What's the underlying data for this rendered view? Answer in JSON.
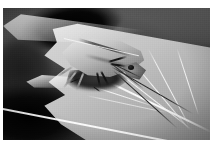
{
  "image": {
    "kind": "photograph",
    "subject": "stink bug (shield bug) resting on the edge of a chewed leaf",
    "color_mode": "grayscale",
    "border": {
      "style": "white photo border",
      "color": "#ffffff",
      "top_px": 8,
      "left_px": 3,
      "right_px": 2,
      "bottom_px": 5
    },
    "canvas": {
      "width_px": 207,
      "height_px": 132
    },
    "palette": {
      "border_white": "#ffffff",
      "leaf_highlight": "#f2f2f2",
      "leaf_midtone": "#c0c0c0",
      "leaf_shadow": "#8f8f8f",
      "background_dark": "#0b0b0b",
      "background_mid": "#4a4a4a",
      "bug_body_light": "#d8d8d8",
      "bug_body_dark": "#6a6a6a",
      "bug_underside": "#202020",
      "limb_dark": "#2e2e2e"
    },
    "regions": [
      {
        "name": "background-foliage",
        "description": "out-of-focus dark foliage filling the upper-left and lower-left corners"
      },
      {
        "name": "leaf",
        "description": "large sunlit leaf occupying the right two thirds, its bright margin running diagonally from upper-left to right"
      },
      {
        "name": "leaf-veins",
        "description": "pale veins radiating from the lower-left toward the upper-right margin",
        "count": 7
      },
      {
        "name": "leaf-damage",
        "description": "torn and chewed notches along the lower-left leaf margin with a dark gap behind"
      },
      {
        "name": "bug",
        "description": "shield-shaped stink bug in profile, head pointing down-right, pale dorsal shield with dark shadowed underside",
        "parts": [
          "pronotum-shield",
          "scutellum-seam",
          "head",
          "eye",
          "underbody-shadow",
          "legs",
          "antennae"
        ]
      },
      {
        "name": "antennae",
        "description": "two long slender antennae sweeping down to the right across the leaf blade"
      }
    ]
  }
}
